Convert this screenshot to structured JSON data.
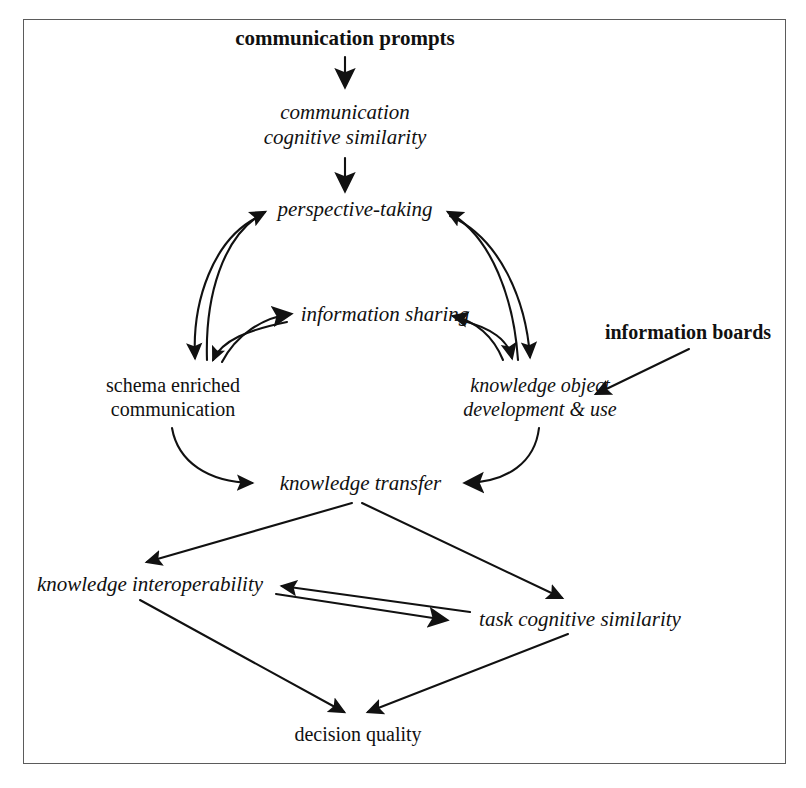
{
  "figure": {
    "type": "concept-diagram",
    "border_color": "#5b5b5b",
    "text_color": "#111111",
    "background": "#ffffff"
  },
  "nodes": {
    "communication_prompts": {
      "label": "communication prompts",
      "style": "bold-roman"
    },
    "communication_cognitive_similarity": {
      "line1": "communication",
      "line2": "cognitive similarity",
      "style": "italic"
    },
    "perspective_taking": {
      "label": "perspective-taking",
      "style": "italic"
    },
    "information_sharing": {
      "label": "information sharing",
      "style": "italic"
    },
    "information_boards": {
      "label": "information boards",
      "style": "bold-roman"
    },
    "schema_enriched_communication": {
      "line1": "schema enriched",
      "line2": "communication",
      "style": "roman"
    },
    "knowledge_object_development": {
      "line1": "knowledge object",
      "line2": "development & use",
      "style": "italic"
    },
    "knowledge_transfer": {
      "label": "knowledge transfer",
      "style": "italic"
    },
    "knowledge_interoperability": {
      "label": "knowledge interoperability",
      "style": "italic"
    },
    "task_cognitive_similarity": {
      "label": "task cognitive similarity",
      "style": "italic"
    },
    "decision_quality": {
      "label": "decision quality",
      "style": "roman"
    }
  },
  "edges": [
    {
      "from": "communication prompts",
      "to": "communication cognitive similarity",
      "shape": "straight",
      "direction": "down"
    },
    {
      "from": "communication cognitive similarity",
      "to": "perspective-taking",
      "shape": "straight",
      "direction": "down"
    },
    {
      "from": "perspective-taking",
      "to": "schema enriched communication",
      "shape": "curved",
      "direction": "down-left"
    },
    {
      "from": "schema enriched communication",
      "to": "perspective-taking",
      "shape": "curved",
      "direction": "up-right"
    },
    {
      "from": "information sharing",
      "to": "schema enriched communication",
      "shape": "curved",
      "direction": "down-left"
    },
    {
      "from": "schema enriched communication",
      "to": "information sharing",
      "shape": "curved",
      "direction": "up-right"
    },
    {
      "from": "perspective-taking",
      "to": "knowledge object development & use",
      "shape": "curved",
      "direction": "down-right"
    },
    {
      "from": "knowledge object development & use",
      "to": "perspective-taking",
      "shape": "curved",
      "direction": "up-left"
    },
    {
      "from": "information sharing",
      "to": "knowledge object development & use",
      "shape": "curved",
      "direction": "down-right"
    },
    {
      "from": "knowledge object development & use",
      "to": "information sharing",
      "shape": "curved",
      "direction": "up-left"
    },
    {
      "from": "schema enriched communication",
      "to": "knowledge transfer",
      "shape": "curved",
      "direction": "down-right"
    },
    {
      "from": "knowledge object development & use",
      "to": "knowledge transfer",
      "shape": "curved",
      "direction": "down-left"
    },
    {
      "from": "information boards",
      "to": "knowledge object development & use",
      "shape": "straight",
      "direction": "down-left"
    },
    {
      "from": "knowledge transfer",
      "to": "knowledge interoperability",
      "shape": "straight",
      "direction": "down-left"
    },
    {
      "from": "knowledge transfer",
      "to": "task cognitive similarity",
      "shape": "straight",
      "direction": "down-right"
    },
    {
      "from": "knowledge interoperability",
      "to": "task cognitive similarity",
      "shape": "straight",
      "direction": "down-right"
    },
    {
      "from": "task cognitive similarity",
      "to": "knowledge interoperability",
      "shape": "straight",
      "direction": "up-left"
    },
    {
      "from": "knowledge interoperability",
      "to": "decision quality",
      "shape": "straight",
      "direction": "down-right"
    },
    {
      "from": "task cognitive similarity",
      "to": "decision quality",
      "shape": "straight",
      "direction": "down-left"
    }
  ]
}
